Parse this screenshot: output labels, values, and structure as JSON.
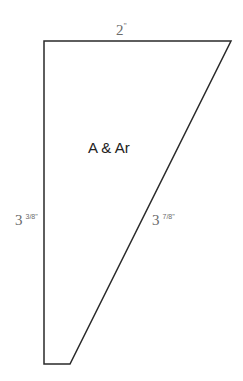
{
  "diagram": {
    "shape": "quadrilateral pattern piece",
    "stroke_color": "#2a2a2a",
    "vertices": [
      [
        44,
        41
      ],
      [
        231,
        41
      ],
      [
        70,
        364
      ],
      [
        44,
        364
      ]
    ],
    "piece_label": "A & Ar",
    "dimensions": {
      "top": {
        "whole": "2",
        "unit": "\""
      },
      "left": {
        "whole": "3",
        "fraction": "3/8\""
      },
      "diagonal": {
        "whole": "3",
        "fraction": "7/8\""
      }
    }
  }
}
